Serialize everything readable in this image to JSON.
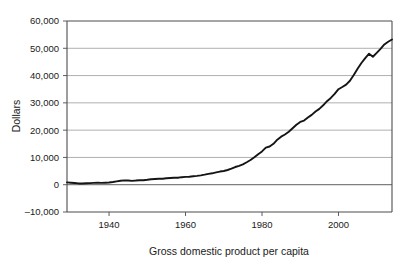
{
  "chart_data": {
    "type": "line",
    "title": "",
    "subtitle": "",
    "xlabel": "Gross domestic product per capita",
    "ylabel": "Dollars",
    "xlim": [
      1929,
      2014
    ],
    "ylim": [
      -10000,
      60000
    ],
    "grid": true,
    "legend": "none",
    "y_ticks": [
      -10000,
      0,
      10000,
      20000,
      30000,
      40000,
      50000,
      60000
    ],
    "y_tick_labels": [
      "–10,000",
      "0",
      "10,000",
      "20,000",
      "30,000",
      "40,000",
      "50,000",
      "60,000"
    ],
    "x_ticks": [
      1940,
      1960,
      1980,
      2000
    ],
    "x_tick_labels": [
      "1940",
      "1960",
      "1980",
      "2000"
    ],
    "series": [
      {
        "name": "Gross domestic product per capita",
        "color": "#151515",
        "x": [
          1929,
          1930,
          1931,
          1932,
          1933,
          1934,
          1935,
          1936,
          1937,
          1938,
          1939,
          1940,
          1941,
          1942,
          1943,
          1944,
          1945,
          1946,
          1947,
          1948,
          1949,
          1950,
          1951,
          1952,
          1953,
          1954,
          1955,
          1956,
          1957,
          1958,
          1959,
          1960,
          1961,
          1962,
          1963,
          1964,
          1965,
          1966,
          1967,
          1968,
          1969,
          1970,
          1971,
          1972,
          1973,
          1974,
          1975,
          1976,
          1977,
          1978,
          1979,
          1980,
          1981,
          1982,
          1983,
          1984,
          1985,
          1986,
          1987,
          1988,
          1989,
          1990,
          1991,
          1992,
          1993,
          1994,
          1995,
          1996,
          1997,
          1998,
          1999,
          2000,
          2001,
          2002,
          2003,
          2004,
          2005,
          2006,
          2007,
          2008,
          2009,
          2010,
          2011,
          2012,
          2013,
          2014
        ],
        "values": [
          850,
          740,
          620,
          470,
          450,
          520,
          590,
          670,
          720,
          670,
          720,
          790,
          980,
          1220,
          1470,
          1580,
          1560,
          1420,
          1520,
          1660,
          1640,
          1800,
          2020,
          2110,
          2200,
          2180,
          2350,
          2450,
          2550,
          2570,
          2760,
          2870,
          2930,
          3100,
          3230,
          3430,
          3680,
          3990,
          4180,
          4510,
          4820,
          5030,
          5400,
          5860,
          6480,
          6920,
          7450,
          8230,
          9060,
          10100,
          11200,
          12200,
          13600,
          14000,
          15000,
          16500,
          17600,
          18400,
          19400,
          20700,
          22000,
          23000,
          23500,
          24600,
          25600,
          26800,
          27800,
          29100,
          30600,
          31800,
          33300,
          35000,
          35800,
          36700,
          38100,
          40200,
          42500,
          44600,
          46400,
          48000,
          46900,
          48300,
          49800,
          51400,
          52400,
          53200
        ]
      }
    ],
    "annotations": []
  },
  "figure": {
    "plot_area": {
      "left": 67,
      "top": 21,
      "right": 392,
      "bottom": 212
    }
  }
}
